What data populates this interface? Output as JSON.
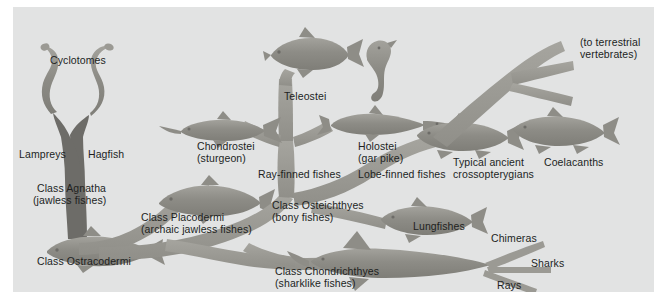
{
  "figure": {
    "type": "phylogenetic-tree",
    "background_color": "#e2e3e3",
    "page_color": "#ffffff",
    "trunk_color": "#6d6c68",
    "branch_color": "#9b9a94",
    "silhouette_color": "#8e8d87",
    "text_color": "#211f1e"
  },
  "labels": {
    "cyclotomes": "Cyclotomes",
    "lampreys": "Lampreys",
    "hagfish": "Hagfish",
    "class_agnatha_l1": "Class Agnatha",
    "class_agnatha_l2": "(jawless fishes)",
    "class_ostracodermi": "Class Ostracodermi",
    "class_placodermi_l1": "Class Placodermi",
    "class_placodermi_l2": "(archaic jawless fishes)",
    "teleostei": "Teleostei",
    "chondrostei_l1": "Chondrostei",
    "chondrostei_l2": "(sturgeon)",
    "holostei_l1": "Holostei",
    "holostei_l2": "(gar pike)",
    "ray_finned_fishes": "Ray-finned fishes",
    "class_osteichthyes_l1": "Class Osteichthyes",
    "class_osteichthyes_l2": "(bony fishes)",
    "lobe_finned_fishes": "Lobe-finned fishes",
    "typical_ancient_l1": "Typical ancient",
    "typical_ancient_l2": "crossopterygians",
    "coelacanths": "Coelacanths",
    "to_terrestrial_l1": "(to terrestrial",
    "to_terrestrial_l2": "vertebrates)",
    "lungfishes": "Lungfishes",
    "class_chondrichthyes_l1": "Class Chondrichthyes",
    "class_chondrichthyes_l2": "(sharklike fishes)",
    "chimeras": "Chimeras",
    "sharks": "Sharks",
    "rays": "Rays"
  },
  "taxa": [
    {
      "name": "Cyclotomes",
      "group": "agnatha",
      "terminal": false
    },
    {
      "name": "Lampreys",
      "group": "agnatha",
      "terminal": true
    },
    {
      "name": "Hagfish",
      "group": "agnatha",
      "terminal": true
    },
    {
      "name": "Class Agnatha (jawless fishes)",
      "group": "agnatha",
      "terminal": false
    },
    {
      "name": "Class Ostracodermi",
      "group": "agnatha",
      "terminal": true
    },
    {
      "name": "Class Placodermi (archaic jawless fishes)",
      "group": "placodermi",
      "terminal": true
    },
    {
      "name": "Chondrostei (sturgeon)",
      "group": "ray-finned",
      "terminal": true
    },
    {
      "name": "Teleostei",
      "group": "ray-finned",
      "terminal": true
    },
    {
      "name": "Holostei (gar pike)",
      "group": "ray-finned",
      "terminal": true
    },
    {
      "name": "Ray-finned fishes",
      "group": "osteichthyes",
      "terminal": false
    },
    {
      "name": "Lobe-finned fishes",
      "group": "osteichthyes",
      "terminal": false
    },
    {
      "name": "Class Osteichthyes (bony fishes)",
      "group": "osteichthyes",
      "terminal": false
    },
    {
      "name": "Typical ancient crossopterygians",
      "group": "lobe-finned",
      "terminal": true
    },
    {
      "name": "Coelacanths",
      "group": "lobe-finned",
      "terminal": true
    },
    {
      "name": "(to terrestrial vertebrates)",
      "group": "lobe-finned",
      "terminal": true
    },
    {
      "name": "Lungfishes",
      "group": "lobe-finned",
      "terminal": true
    },
    {
      "name": "Class Chondrichthyes (sharklike fishes)",
      "group": "chondrichthyes",
      "terminal": false
    },
    {
      "name": "Chimeras",
      "group": "chondrichthyes",
      "terminal": true
    },
    {
      "name": "Sharks",
      "group": "chondrichthyes",
      "terminal": true
    },
    {
      "name": "Rays",
      "group": "chondrichthyes",
      "terminal": true
    }
  ]
}
